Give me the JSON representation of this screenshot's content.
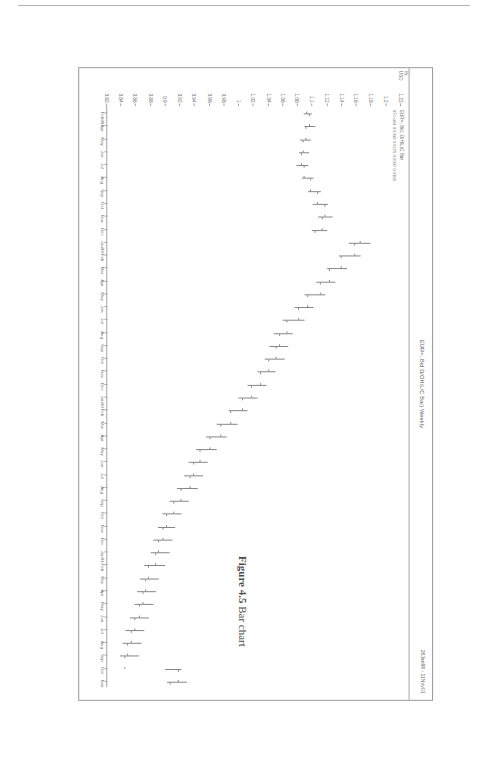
{
  "page": {
    "figure_caption_label": "Figure 4.5",
    "figure_caption_text": "Bar chart"
  },
  "chart": {
    "header_title": "EUR=, Bid D/OH/L/C Bar) Weekly",
    "header_date_range": "26Jan98 - 11Nov01",
    "legend": [
      "EUR=, Bid, O/H/L/C Bar",
      "07Oct01 0.9030 0.9225 0.9007 0.9185"
    ],
    "y_axis_unit_top": "Pr",
    "y_axis_unit_bottom": "USD"
  },
  "chart_data": {
    "type": "bar",
    "subtype": "ohlc",
    "title": "EUR=, Bid D/OH/L/C Bar) Weekly",
    "subtitle": "26Jan98 - 11Nov01",
    "xlabel": "",
    "ylabel": "Pr USD",
    "ylim": [
      0.82,
      1.23
    ],
    "grid": false,
    "legend_position": "top-left",
    "ytick_labels": [
      "1.22",
      "1.2",
      "1.18",
      "1.16",
      "1.14",
      "1.12",
      "1.1",
      "1.08",
      "1.06",
      "1.04",
      "1.02",
      "1",
      "0.98",
      "0.96",
      "0.94",
      "0.92",
      "0.9",
      "0.88",
      "0.86",
      "0.84",
      "0.82"
    ],
    "ytick_values": [
      1.22,
      1.2,
      1.18,
      1.16,
      1.14,
      1.12,
      1.1,
      1.08,
      1.06,
      1.04,
      1.02,
      1.0,
      0.98,
      0.96,
      0.94,
      0.92,
      0.9,
      0.88,
      0.86,
      0.84,
      0.82
    ],
    "xtick_labels": [
      "Feb98",
      "Apr",
      "May",
      "Jun",
      "Jul",
      "Aug",
      "Sep",
      "Oct",
      "Nov",
      "Dec",
      "Jan99",
      "Feb",
      "Mar",
      "Apr",
      "May",
      "Jun",
      "Jul",
      "Aug",
      "Sep",
      "Oct",
      "Nov",
      "Dec",
      "Jan00",
      "Feb",
      "Mar",
      "Apr",
      "May",
      "Jun",
      "Jul",
      "Aug",
      "Sep",
      "Oct",
      "Nov",
      "Dec",
      "Jan01",
      "Feb",
      "Mar",
      "Apr",
      "May",
      "Jun",
      "Jul",
      "Aug",
      "Sep",
      "Oct",
      "Nov"
    ],
    "categories": [
      "Feb98",
      "Apr",
      "May",
      "Jun",
      "Jul",
      "Aug",
      "Sep",
      "Oct",
      "Nov",
      "Dec",
      "Jan99",
      "Feb",
      "Mar",
      "Apr",
      "May",
      "Jun",
      "Jul",
      "Aug",
      "Sep",
      "Oct",
      "Nov",
      "Dec",
      "Jan00",
      "Feb",
      "Mar",
      "Apr",
      "May",
      "Jun",
      "Jul",
      "Aug",
      "Sep",
      "Oct",
      "Nov",
      "Dec",
      "Jan01",
      "Feb",
      "Mar",
      "Apr",
      "May",
      "Jun",
      "Jul",
      "Aug",
      "Sep",
      "Oct",
      "Nov"
    ],
    "series": [
      {
        "name": "EUR=, Bid, O/H/L/C Bar",
        "bars": [
          {
            "o": 1.093,
            "h": 1.1,
            "l": 1.088,
            "c": 1.097
          },
          {
            "o": 1.097,
            "h": 1.104,
            "l": 1.09,
            "c": 1.092
          },
          {
            "o": 1.092,
            "h": 1.098,
            "l": 1.084,
            "c": 1.089
          },
          {
            "o": 1.089,
            "h": 1.096,
            "l": 1.082,
            "c": 1.086
          },
          {
            "o": 1.086,
            "h": 1.095,
            "l": 1.079,
            "c": 1.09
          },
          {
            "o": 1.09,
            "h": 1.102,
            "l": 1.086,
            "c": 1.098
          },
          {
            "o": 1.098,
            "h": 1.112,
            "l": 1.094,
            "c": 1.108
          },
          {
            "o": 1.108,
            "h": 1.122,
            "l": 1.101,
            "c": 1.118
          },
          {
            "o": 1.118,
            "h": 1.128,
            "l": 1.108,
            "c": 1.114
          },
          {
            "o": 1.114,
            "h": 1.12,
            "l": 1.1,
            "c": 1.105
          },
          {
            "o": 1.166,
            "h": 1.18,
            "l": 1.15,
            "c": 1.158
          },
          {
            "o": 1.158,
            "h": 1.166,
            "l": 1.136,
            "c": 1.14
          },
          {
            "o": 1.14,
            "h": 1.148,
            "l": 1.12,
            "c": 1.124
          },
          {
            "o": 1.124,
            "h": 1.132,
            "l": 1.106,
            "c": 1.112
          },
          {
            "o": 1.112,
            "h": 1.118,
            "l": 1.09,
            "c": 1.094
          },
          {
            "o": 1.094,
            "h": 1.102,
            "l": 1.076,
            "c": 1.082
          },
          {
            "o": 1.082,
            "h": 1.09,
            "l": 1.06,
            "c": 1.066
          },
          {
            "o": 1.066,
            "h": 1.074,
            "l": 1.048,
            "c": 1.056
          },
          {
            "o": 1.056,
            "h": 1.068,
            "l": 1.042,
            "c": 1.052
          },
          {
            "o": 1.052,
            "h": 1.062,
            "l": 1.036,
            "c": 1.042
          },
          {
            "o": 1.042,
            "h": 1.05,
            "l": 1.026,
            "c": 1.03
          },
          {
            "o": 1.03,
            "h": 1.038,
            "l": 1.012,
            "c": 1.018
          },
          {
            "o": 1.018,
            "h": 1.026,
            "l": 1.0,
            "c": 1.006
          },
          {
            "o": 1.006,
            "h": 1.012,
            "l": 0.986,
            "c": 0.99
          },
          {
            "o": 0.99,
            "h": 0.998,
            "l": 0.97,
            "c": 0.976
          },
          {
            "o": 0.976,
            "h": 0.984,
            "l": 0.956,
            "c": 0.962
          },
          {
            "o": 0.962,
            "h": 0.97,
            "l": 0.942,
            "c": 0.948
          },
          {
            "o": 0.948,
            "h": 0.958,
            "l": 0.932,
            "c": 0.94
          },
          {
            "o": 0.94,
            "h": 0.952,
            "l": 0.926,
            "c": 0.934
          },
          {
            "o": 0.934,
            "h": 0.944,
            "l": 0.916,
            "c": 0.922
          },
          {
            "o": 0.922,
            "h": 0.932,
            "l": 0.906,
            "c": 0.912
          },
          {
            "o": 0.912,
            "h": 0.922,
            "l": 0.896,
            "c": 0.902
          },
          {
            "o": 0.902,
            "h": 0.914,
            "l": 0.89,
            "c": 0.898
          },
          {
            "o": 0.898,
            "h": 0.91,
            "l": 0.884,
            "c": 0.892
          },
          {
            "o": 0.892,
            "h": 0.906,
            "l": 0.88,
            "c": 0.888
          },
          {
            "o": 0.888,
            "h": 0.9,
            "l": 0.872,
            "c": 0.878
          },
          {
            "o": 0.878,
            "h": 0.892,
            "l": 0.866,
            "c": 0.874
          },
          {
            "o": 0.874,
            "h": 0.888,
            "l": 0.862,
            "c": 0.87
          },
          {
            "o": 0.87,
            "h": 0.884,
            "l": 0.858,
            "c": 0.866
          },
          {
            "o": 0.866,
            "h": 0.878,
            "l": 0.852,
            "c": 0.86
          },
          {
            "o": 0.86,
            "h": 0.872,
            "l": 0.846,
            "c": 0.854
          },
          {
            "o": 0.854,
            "h": 0.868,
            "l": 0.842,
            "c": 0.85
          },
          {
            "o": 0.85,
            "h": 0.864,
            "l": 0.838,
            "c": 0.846
          },
          {
            "o": 0.846,
            "h": 0.922,
            "l": 0.9,
            "c": 0.918
          },
          {
            "o": 0.918,
            "h": 0.93,
            "l": 0.902,
            "c": 0.908
          }
        ]
      }
    ],
    "annotation": "07Oct01 0.9030 0.9225 0.9007 0.9185"
  }
}
